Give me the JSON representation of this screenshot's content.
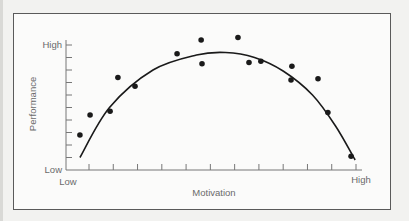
{
  "chart_data": {
    "type": "scatter",
    "title": "",
    "xlabel": "Motivation",
    "ylabel": "Performance",
    "x_tick_labels": {
      "min": "Low",
      "max": "High"
    },
    "y_tick_labels": {
      "min": "Low",
      "max": "High"
    },
    "xlim": [
      0,
      10
    ],
    "ylim": [
      0,
      10
    ],
    "x_ticks": 13,
    "y_ticks": 11,
    "grid": false,
    "legend": null,
    "points": [
      {
        "x": 0.48,
        "y": 2.8
      },
      {
        "x": 0.83,
        "y": 4.4
      },
      {
        "x": 1.52,
        "y": 4.7
      },
      {
        "x": 1.79,
        "y": 7.4
      },
      {
        "x": 2.38,
        "y": 6.7
      },
      {
        "x": 3.83,
        "y": 9.3
      },
      {
        "x": 4.66,
        "y": 10.4
      },
      {
        "x": 4.69,
        "y": 8.5
      },
      {
        "x": 5.93,
        "y": 10.6
      },
      {
        "x": 6.31,
        "y": 8.6
      },
      {
        "x": 6.72,
        "y": 8.7
      },
      {
        "x": 7.76,
        "y": 7.2
      },
      {
        "x": 7.79,
        "y": 8.3
      },
      {
        "x": 8.69,
        "y": 7.3
      },
      {
        "x": 9.03,
        "y": 4.6
      },
      {
        "x": 9.83,
        "y": 1.1
      }
    ],
    "fit_curve": {
      "shape": "inverted-U",
      "description": "Fitted curve rising from low performance, peaking near moderate-high motivation, then falling sharply at high motivation",
      "points": [
        {
          "x": 0.48,
          "y": 1.0
        },
        {
          "x": 1.5,
          "y": 5.0
        },
        {
          "x": 3.0,
          "y": 8.0
        },
        {
          "x": 4.5,
          "y": 9.2
        },
        {
          "x": 5.5,
          "y": 9.4
        },
        {
          "x": 6.5,
          "y": 9.0
        },
        {
          "x": 7.5,
          "y": 7.9
        },
        {
          "x": 8.5,
          "y": 6.0
        },
        {
          "x": 9.3,
          "y": 3.5
        },
        {
          "x": 9.97,
          "y": 0.8
        }
      ]
    }
  },
  "labels": {
    "y_axis": "Performance",
    "x_axis": "Motivation",
    "y_high": "High",
    "y_low": "Low",
    "x_low": "Low",
    "x_high": "High"
  },
  "colors": {
    "ink": "#1a1a1a",
    "label": "#6a6a6a",
    "axis": "#777777",
    "frame": "#5a5a5a",
    "paper": "#fbfbfa"
  }
}
